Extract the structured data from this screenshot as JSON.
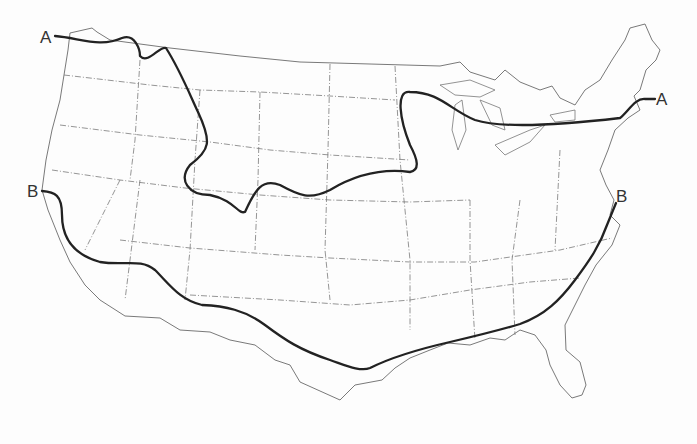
{
  "map": {
    "subject": "Contiguous United States outline map with state boundaries",
    "lines": [
      {
        "id": "A",
        "label": "A",
        "description": "Northern line from Pacific Northwest across northern Plains/Great Lakes to New England"
      },
      {
        "id": "B",
        "label": "B",
        "description": "Southern line from central California across Southwest and Gulf coast to Virginia"
      }
    ],
    "labels": {
      "A_west": "A",
      "A_east": "A",
      "B_west": "B",
      "B_east": "B"
    },
    "colors": {
      "curve": "#222222",
      "outline": "#6a6a6a",
      "background": "#fdfdfd"
    }
  }
}
